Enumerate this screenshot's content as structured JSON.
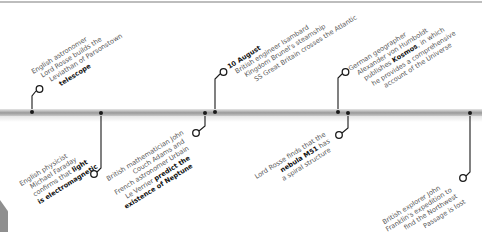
{
  "timeline": {
    "events": [
      {
        "id": "rosse-telescope",
        "position": "above",
        "lines": [
          "English astronomer",
          "Lord Rosse builds the",
          "Leviathan of Parsonstown"
        ],
        "bold_line": "telescope"
      },
      {
        "id": "faraday",
        "position": "below",
        "lines": [
          "English physicist",
          "Michael Faraday",
          "confirms that"
        ],
        "bold_inline": "light",
        "bold_line": "is electromagnetic"
      },
      {
        "id": "neptune",
        "position": "below",
        "lines": [
          "British mathematician John",
          "Couch Adams and",
          "French astronomer Urbain"
        ],
        "line4_plain": "Le Verrier",
        "line4_bold": "predict the",
        "bold_line": "existence of Neptune"
      },
      {
        "id": "great-britain",
        "position": "above",
        "heading": "10 August",
        "lines": [
          "British engineer Isambard",
          "Kingdom Brunel's steamship",
          "SS Great Britain crosses the Atlantic"
        ]
      },
      {
        "id": "m51",
        "position": "below",
        "line1": "Lord Rosse finds that the",
        "line2_bold": "nebula M51",
        "line2_plain": "has",
        "line3": "a spiral structure"
      },
      {
        "id": "kosmos",
        "position": "above",
        "lines": [
          "German geographer",
          "Alexander von Humboldt"
        ],
        "line3_plain_a": "publishes",
        "line3_bold": "Kosmos",
        "line3_plain_b": ", in which",
        "lines_after": [
          "he provides a comprehensive",
          "account of the Universe"
        ]
      },
      {
        "id": "franklin",
        "position": "below",
        "lines": [
          "British explorer John",
          "Franklin's expedition to",
          "find the Northwest",
          "Passage is lost"
        ]
      }
    ]
  },
  "colors": {
    "text": "#5a5a5a",
    "bold_text": "#111111",
    "connector": "#1a1a1a",
    "bar": "#a8a8a8"
  }
}
